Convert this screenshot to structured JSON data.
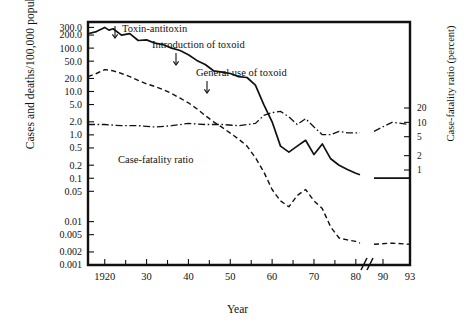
{
  "chart_data": {
    "type": "line",
    "title": "",
    "xlabel": "Year",
    "ylabel": "Cases and deaths/100,000 population",
    "ylabel_right": "Case-fatality ratio (percent)",
    "xlim": [
      1916,
      1993
    ],
    "x_axis_break": {
      "after": 1981,
      "before": 1989,
      "label": "axis-break"
    },
    "xticks_major": [
      1920,
      1930,
      1940,
      1950,
      1960,
      1970,
      1980,
      1990,
      1993
    ],
    "xtick_labels": [
      "1920",
      "30",
      "40",
      "50",
      "60",
      "70",
      "80",
      "90",
      "93"
    ],
    "xticks_minor": [
      1925,
      1935,
      1945,
      1955,
      1965,
      1975
    ],
    "yscale": "log",
    "ylim": [
      0.001,
      400
    ],
    "yticks": [
      300.0,
      200.0,
      100.0,
      50.0,
      20.0,
      10.0,
      5.0,
      2.0,
      1.0,
      0.5,
      0.2,
      0.1,
      0.05,
      0.01,
      0.005,
      0.002,
      0.001
    ],
    "ytick_labels": [
      "300.0",
      "200.0",
      "100.0",
      "50.0",
      "20.0",
      "10.0",
      "5.0",
      "2.0",
      "1.0",
      "0.5",
      "0.2",
      "0.1",
      "0.05",
      "0.01",
      "0.005",
      "0.002",
      "0.001"
    ],
    "right_axis": {
      "scale": "log",
      "ticks": [
        20,
        10,
        5,
        2,
        1
      ],
      "tick_labels": [
        "20",
        "10",
        "5",
        "2",
        "1"
      ]
    },
    "grid": false,
    "legend": "inline-annotation",
    "series": [
      {
        "name": "Cases",
        "style": "solid",
        "axis": "left",
        "x": [
          1916,
          1918,
          1920,
          1921,
          1922,
          1924,
          1926,
          1928,
          1930,
          1932,
          1934,
          1936,
          1938,
          1940,
          1942,
          1944,
          1946,
          1948,
          1950,
          1952,
          1954,
          1956,
          1958,
          1960,
          1962,
          1964,
          1966,
          1968,
          1970,
          1972,
          1974,
          1976,
          1978,
          1980,
          1981,
          1989,
          1991,
          1993
        ],
        "values": [
          215,
          240,
          300,
          260,
          280,
          200,
          215,
          150,
          155,
          130,
          120,
          100,
          88,
          70,
          52,
          42,
          30,
          28,
          26,
          22,
          21,
          14,
          5.0,
          2.0,
          0.55,
          0.4,
          0.55,
          0.75,
          0.35,
          0.62,
          0.28,
          0.2,
          0.16,
          0.13,
          0.12,
          0.1,
          0.1,
          0.1
        ]
      },
      {
        "name": "Deaths",
        "style": "dashed",
        "axis": "left",
        "x": [
          1916,
          1918,
          1920,
          1922,
          1924,
          1926,
          1928,
          1930,
          1932,
          1934,
          1936,
          1938,
          1940,
          1942,
          1944,
          1946,
          1948,
          1950,
          1952,
          1954,
          1956,
          1958,
          1960,
          1962,
          1964,
          1966,
          1968,
          1970,
          1972,
          1974,
          1976,
          1978,
          1980,
          1981,
          1989,
          1991,
          1993
        ],
        "values": [
          22,
          26,
          32,
          30,
          26,
          22,
          18,
          15,
          13,
          11,
          9.0,
          7.0,
          5.5,
          4.0,
          2.8,
          2.0,
          1.5,
          1.1,
          0.8,
          0.55,
          0.3,
          0.14,
          0.055,
          0.03,
          0.022,
          0.04,
          0.055,
          0.03,
          0.02,
          0.0075,
          0.0042,
          0.0038,
          0.0035,
          0.0032,
          0.003,
          0.0032,
          0.003
        ]
      },
      {
        "name": "Case-fatality ratio",
        "style": "dash-dot",
        "axis": "right",
        "x": [
          1916,
          1920,
          1924,
          1928,
          1932,
          1936,
          1940,
          1944,
          1948,
          1952,
          1956,
          1958,
          1960,
          1962,
          1964,
          1966,
          1968,
          1970,
          1972,
          1974,
          1976,
          1978,
          1980,
          1981,
          1989,
          1991,
          1993
        ],
        "values": [
          9.0,
          9.0,
          8.5,
          8.5,
          8.0,
          8.5,
          9.5,
          9.0,
          9.0,
          8.5,
          9.5,
          14.0,
          16.0,
          17.0,
          13.0,
          9.0,
          12.0,
          8.0,
          5.5,
          5.5,
          6.5,
          6.0,
          6.0,
          6.0,
          6.5,
          10.0,
          9.0
        ]
      }
    ],
    "annotations": [
      {
        "text": "Toxin-antitoxin",
        "arrow": "down"
      },
      {
        "text": "Introduction of toxoid",
        "arrow": "down"
      },
      {
        "text": "General use of toxoid",
        "arrow": "down"
      },
      {
        "text": "Case-fatality ratio",
        "arrow": "none"
      }
    ]
  }
}
